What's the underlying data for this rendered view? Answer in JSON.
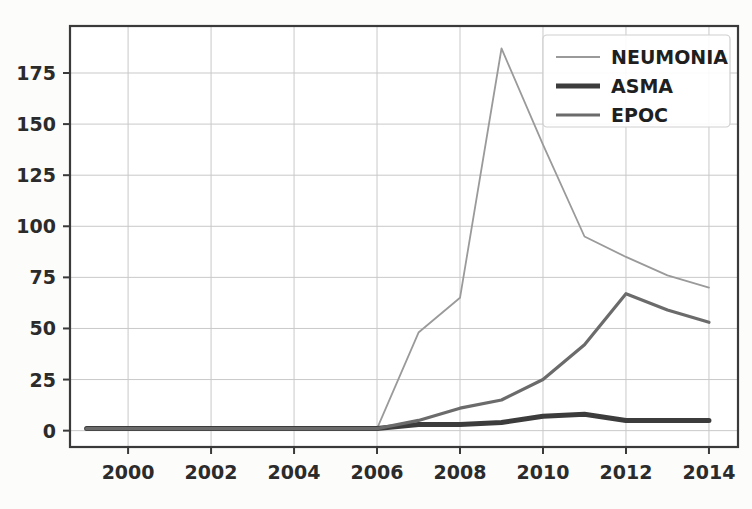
{
  "figure": {
    "background_color": "#fcfcfb",
    "plot_background_color": "#ffffff",
    "axis_color": "#3a3a3a",
    "grid_color": "#c9c9c9"
  },
  "chart_data": {
    "type": "line",
    "title": "",
    "xlabel": "",
    "ylabel": "",
    "x": [
      1999,
      2000,
      2001,
      2002,
      2003,
      2004,
      2005,
      2006,
      2007,
      2008,
      2009,
      2010,
      2011,
      2012,
      2013,
      2014
    ],
    "xlim": [
      1998.6,
      2014.7
    ],
    "ylim": [
      -8,
      198
    ],
    "xticks": [
      2000,
      2002,
      2004,
      2006,
      2008,
      2010,
      2012,
      2014
    ],
    "xtick_labels": [
      "2000",
      "2002",
      "2004",
      "2006",
      "2008",
      "2010",
      "2012",
      "2014"
    ],
    "yticks": [
      0,
      25,
      50,
      75,
      100,
      125,
      150,
      175
    ],
    "ytick_labels": [
      "0",
      "25",
      "50",
      "75",
      "100",
      "125",
      "150",
      "175"
    ],
    "grid": true,
    "legend_position": "upper right",
    "series": [
      {
        "name": "NEUMONIA",
        "color": "#9a9a9a",
        "width": 1.8,
        "values": [
          1,
          1,
          1,
          1,
          1,
          1,
          1,
          1,
          48,
          65,
          187,
          140,
          95,
          85,
          76,
          70
        ]
      },
      {
        "name": "ASMA",
        "color": "#3c3c3c",
        "width": 5.0,
        "values": [
          1,
          1,
          1,
          1,
          1,
          1,
          1,
          1,
          3,
          3,
          4,
          7,
          8,
          5,
          5,
          5
        ]
      },
      {
        "name": "EPOC",
        "color": "#6b6b6b",
        "width": 3.2,
        "values": [
          1,
          1,
          1,
          1,
          1,
          1,
          1,
          1,
          5,
          11,
          15,
          25,
          42,
          67,
          59,
          53
        ]
      }
    ]
  },
  "legend": {
    "entries": [
      {
        "label": "NEUMONIA",
        "color": "#9a9a9a",
        "width": 1.8
      },
      {
        "label": "ASMA",
        "color": "#3c3c3c",
        "width": 5.0
      },
      {
        "label": "EPOC",
        "color": "#6b6b6b",
        "width": 3.2
      }
    ]
  }
}
